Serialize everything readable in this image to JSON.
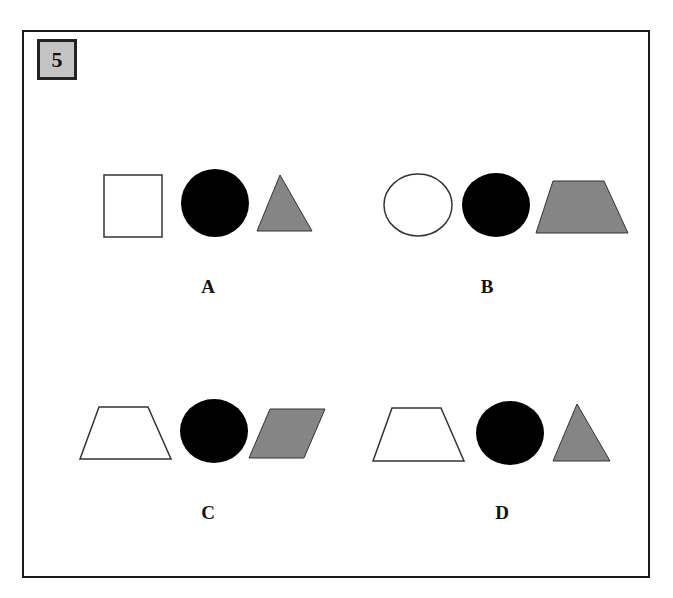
{
  "question": {
    "number": "5"
  },
  "colors": {
    "frame": "#1a1a1a",
    "number_box_fill": "#c4c4c4",
    "black_fill": "#000000",
    "gray_fill": "#858585",
    "white_fill": "#ffffff",
    "outline": "#333333"
  },
  "options": [
    {
      "label": "A",
      "shapes": [
        "white-square",
        "black-circle",
        "gray-triangle"
      ]
    },
    {
      "label": "B",
      "shapes": [
        "white-circle",
        "black-circle",
        "gray-trapezoid"
      ]
    },
    {
      "label": "C",
      "shapes": [
        "white-trapezoid",
        "black-circle",
        "gray-parallelogram"
      ]
    },
    {
      "label": "D",
      "shapes": [
        "white-trapezoid",
        "black-circle",
        "gray-triangle"
      ]
    }
  ]
}
